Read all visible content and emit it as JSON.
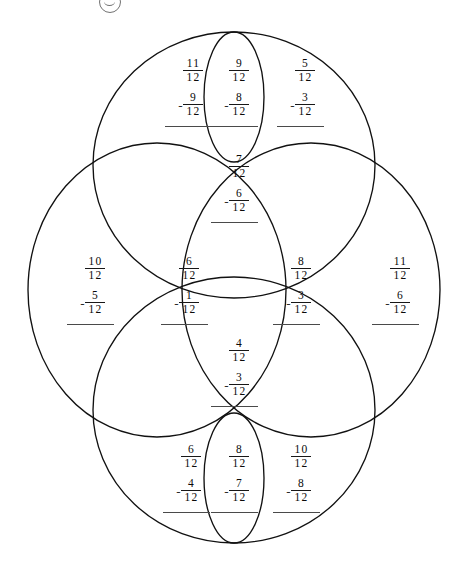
{
  "page": {
    "stamp_icon": "circle-stamp-icon",
    "operator": "-",
    "denominator": "12"
  },
  "problems": [
    {
      "id": "top-left",
      "region": "top-petal-left",
      "numerator1": "11",
      "denominator1": "12",
      "operator": "-",
      "numerator2": "9",
      "denominator2": "12"
    },
    {
      "id": "top-center",
      "region": "top-small-ellipse",
      "numerator1": "9",
      "denominator1": "12",
      "operator": "-",
      "numerator2": "8",
      "denominator2": "12"
    },
    {
      "id": "top-right",
      "region": "top-petal-right",
      "numerator1": "5",
      "denominator1": "12",
      "operator": "-",
      "numerator2": "3",
      "denominator2": "12"
    },
    {
      "id": "upper-middle",
      "region": "upper-lens",
      "numerator1": "7",
      "denominator1": "12",
      "operator": "-",
      "numerator2": "6",
      "denominator2": "12"
    },
    {
      "id": "mid-far-left",
      "region": "left-large-ellipse",
      "numerator1": "10",
      "denominator1": "12",
      "operator": "-",
      "numerator2": "5",
      "denominator2": "12"
    },
    {
      "id": "mid-left",
      "region": "center-left-ellipse",
      "numerator1": "6",
      "denominator1": "12",
      "operator": "-",
      "numerator2": "1",
      "denominator2": "12"
    },
    {
      "id": "mid-right",
      "region": "center-right-ellipse",
      "numerator1": "8",
      "denominator1": "12",
      "operator": "-",
      "numerator2": "3",
      "denominator2": "12"
    },
    {
      "id": "mid-far-right",
      "region": "right-large-ellipse",
      "numerator1": "11",
      "denominator1": "12",
      "operator": "-",
      "numerator2": "6",
      "denominator2": "12"
    },
    {
      "id": "lower-middle",
      "region": "lower-lens",
      "numerator1": "4",
      "denominator1": "12",
      "operator": "-",
      "numerator2": "3",
      "denominator2": "12"
    },
    {
      "id": "bottom-left",
      "region": "bottom-petal-left",
      "numerator1": "6",
      "denominator1": "12",
      "operator": "-",
      "numerator2": "4",
      "denominator2": "12"
    },
    {
      "id": "bottom-center",
      "region": "bottom-small-ellipse",
      "numerator1": "8",
      "denominator1": "12",
      "operator": "-",
      "numerator2": "7",
      "denominator2": "12"
    },
    {
      "id": "bottom-right",
      "region": "bottom-petal-right",
      "numerator1": "10",
      "denominator1": "12",
      "operator": "-",
      "numerator2": "8",
      "denominator2": "12"
    }
  ],
  "shapes": {
    "stroke_color": "#111111",
    "fill": "none",
    "ellipses": [
      {
        "name": "top-large-ellipse",
        "cx": 234,
        "cy": 165,
        "rx": 141,
        "ry": 133
      },
      {
        "name": "bottom-large-ellipse",
        "cx": 234,
        "cy": 410,
        "rx": 141,
        "ry": 133
      },
      {
        "name": "left-large-ellipse",
        "cx": 157,
        "cy": 290,
        "rx": 129,
        "ry": 147
      },
      {
        "name": "right-large-ellipse",
        "cx": 311,
        "cy": 290,
        "rx": 129,
        "ry": 147
      },
      {
        "name": "top-small-ellipse",
        "cx": 234,
        "cy": 97,
        "rx": 30,
        "ry": 65
      },
      {
        "name": "bottom-small-ellipse",
        "cx": 234,
        "cy": 478,
        "rx": 30,
        "ry": 65
      }
    ]
  }
}
